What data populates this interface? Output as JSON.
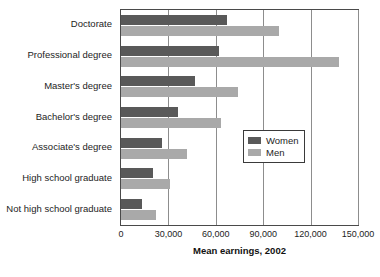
{
  "chart_data": {
    "type": "bar",
    "orientation": "horizontal",
    "title": "",
    "xlabel": "Mean earnings, 2002",
    "ylabel": "",
    "xlim": [
      0,
      150000
    ],
    "xticks": [
      0,
      30000,
      60000,
      90000,
      120000,
      150000
    ],
    "xtick_labels": [
      "0",
      "30,000",
      "60,000",
      "90,000",
      "120,000",
      "150,000"
    ],
    "grid": true,
    "grid_axis": "x",
    "legend_position": "center-right",
    "categories": [
      "Doctorate",
      "Professional degree",
      "Master's degree",
      "Bachelor's degree",
      "Associate's degree",
      "High school graduate",
      "Not high school graduate"
    ],
    "series": [
      {
        "name": "Women",
        "color": "#595959",
        "values": [
          67000,
          62000,
          47000,
          36000,
          26000,
          20000,
          13000
        ]
      },
      {
        "name": "Men",
        "color": "#a9a9a9",
        "values": [
          100000,
          138000,
          74000,
          63000,
          42000,
          31000,
          22000
        ]
      }
    ]
  },
  "legend": {
    "items": [
      {
        "label": "Women",
        "color": "#595959"
      },
      {
        "label": "Men",
        "color": "#a9a9a9"
      }
    ]
  }
}
